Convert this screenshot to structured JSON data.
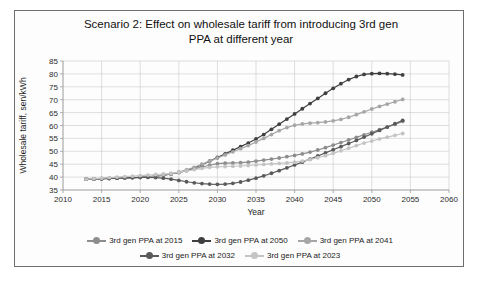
{
  "chart_data": {
    "type": "line",
    "title": "Scenario 2: Effect on wholesale tariff from introducing 3rd gen PPA at different year",
    "title_line1": "Scenario 2: Effect on wholesale tariff from introducing 3rd gen",
    "title_line2": "PPA at different year",
    "xlabel": "Year",
    "ylabel": "Wholesale tariff, sen/kWh",
    "xlim": [
      2010,
      2060
    ],
    "ylim": [
      35,
      85
    ],
    "xticks": [
      2010,
      2015,
      2020,
      2025,
      2030,
      2035,
      2040,
      2045,
      2050,
      2055,
      2060
    ],
    "yticks": [
      35,
      40,
      45,
      50,
      55,
      60,
      65,
      70,
      75,
      80,
      85
    ],
    "grid": true,
    "legend_position": "bottom",
    "x": [
      2013,
      2014,
      2015,
      2016,
      2017,
      2018,
      2019,
      2020,
      2021,
      2022,
      2023,
      2024,
      2025,
      2026,
      2027,
      2028,
      2029,
      2030,
      2031,
      2032,
      2033,
      2034,
      2035,
      2036,
      2037,
      2038,
      2039,
      2040,
      2041,
      2042,
      2043,
      2044,
      2045,
      2046,
      2047,
      2048,
      2049,
      2050,
      2051,
      2052,
      2053,
      2054
    ],
    "series": [
      {
        "name": "3rd gen PPA at 2015",
        "color": "#8d8d8d",
        "values": [
          39.2,
          39.3,
          39.4,
          39.5,
          39.6,
          39.7,
          39.8,
          39.9,
          40.1,
          40.4,
          40.8,
          41.2,
          41.8,
          42.5,
          43.2,
          43.9,
          44.6,
          45.2,
          45.4,
          45.5,
          45.6,
          45.8,
          46.2,
          46.6,
          47.0,
          47.4,
          47.9,
          48.4,
          49.0,
          49.7,
          50.5,
          51.4,
          52.4,
          53.4,
          54.4,
          55.4,
          56.4,
          57.4,
          58.4,
          59.4,
          60.4,
          61.6
        ]
      },
      {
        "name": "3rd gen PPA at 2050",
        "color": "#3f3f3f",
        "values": [
          39.2,
          39.3,
          39.4,
          39.5,
          39.6,
          39.7,
          39.8,
          39.9,
          40.1,
          40.4,
          40.8,
          41.2,
          41.8,
          42.6,
          43.6,
          44.8,
          46.2,
          47.6,
          49.0,
          50.4,
          51.8,
          53.2,
          54.8,
          56.5,
          58.5,
          60.5,
          62.5,
          64.5,
          66.5,
          68.5,
          70.5,
          72.5,
          74.4,
          76.2,
          77.8,
          79.0,
          79.8,
          80.1,
          80.2,
          80.1,
          79.9,
          79.6
        ]
      },
      {
        "name": "3rd gen PPA at 2041",
        "color": "#a6a6a6",
        "values": [
          39.2,
          39.3,
          39.4,
          39.5,
          39.6,
          39.7,
          39.8,
          39.9,
          40.1,
          40.4,
          40.8,
          41.2,
          41.9,
          42.8,
          43.8,
          45.0,
          46.2,
          47.4,
          48.6,
          49.8,
          51.0,
          52.2,
          53.6,
          55.0,
          56.5,
          58.0,
          59.2,
          60.1,
          60.6,
          60.9,
          61.1,
          61.4,
          61.8,
          62.4,
          63.2,
          64.2,
          65.3,
          66.4,
          67.4,
          68.3,
          69.2,
          70.1
        ]
      },
      {
        "name": "3rd gen PPA at 2032",
        "color": "#5a5a5a",
        "values": [
          39.2,
          39.3,
          39.4,
          39.5,
          39.6,
          39.7,
          39.8,
          39.9,
          39.9,
          39.8,
          39.6,
          39.2,
          38.7,
          38.2,
          37.8,
          37.5,
          37.3,
          37.2,
          37.3,
          37.6,
          38.1,
          38.8,
          39.6,
          40.5,
          41.5,
          42.5,
          43.6,
          44.7,
          45.8,
          47.0,
          48.2,
          49.4,
          50.6,
          51.8,
          53.0,
          54.2,
          55.5,
          56.8,
          58.1,
          59.4,
          60.7,
          62.0
        ]
      },
      {
        "name": "3rd gen PPA at 2023",
        "color": "#c4c4c4",
        "values": [
          39.2,
          39.4,
          39.6,
          39.8,
          40.0,
          40.2,
          40.4,
          40.6,
          40.8,
          41.0,
          41.2,
          41.5,
          41.9,
          42.4,
          42.9,
          43.4,
          43.8,
          44.0,
          44.1,
          44.2,
          44.3,
          44.5,
          44.7,
          44.9,
          45.1,
          45.3,
          45.5,
          45.8,
          46.2,
          46.8,
          47.5,
          48.3,
          49.2,
          50.2,
          51.2,
          52.2,
          53.2,
          54.0,
          54.8,
          55.5,
          56.2,
          56.9
        ]
      }
    ]
  }
}
